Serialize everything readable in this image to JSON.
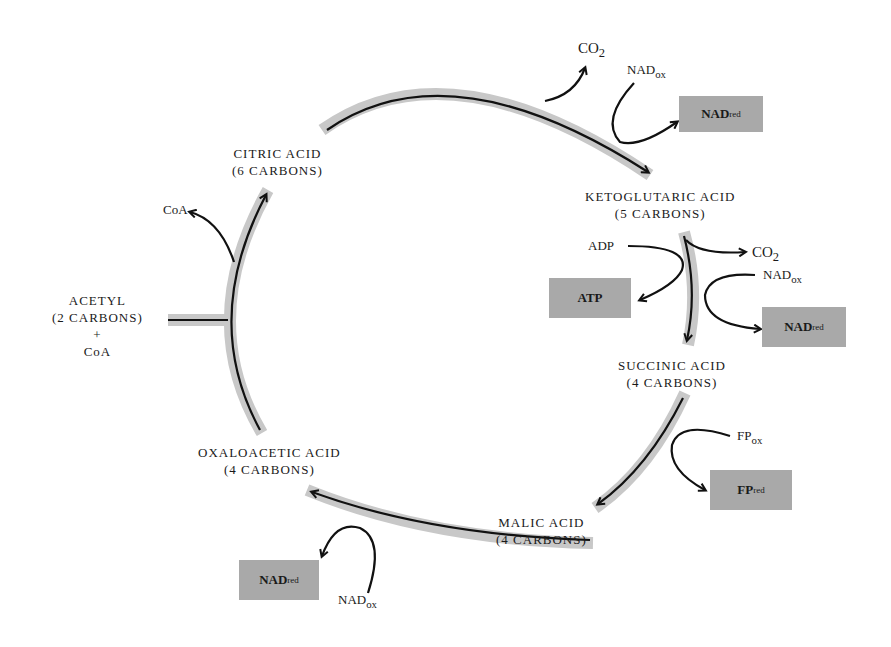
{
  "diagram": {
    "colors": {
      "band": "#c8c8c8",
      "arrow": "#111111",
      "box": "#a9a9a9"
    },
    "compounds": {
      "citric": {
        "name": "CITRIC ACID",
        "carbons": "(6 CARBONS)"
      },
      "ketoglutaric": {
        "name": "KETOGLUTARIC ACID",
        "carbons": "(5 CARBONS)"
      },
      "succinic": {
        "name": "SUCCINIC ACID",
        "carbons": "(4 CARBONS)"
      },
      "malic": {
        "name": "MALIC ACID",
        "carbons": "(4 CARBONS)"
      },
      "oxaloacetic": {
        "name": "OXALOACETIC ACID",
        "carbons": "(4 CARBONS)"
      },
      "acetyl": {
        "name": "ACETYL",
        "carbons": "(2 CARBONS)",
        "plus": "+",
        "coa": "CoA"
      }
    },
    "side": {
      "coa_out": "CoA",
      "co2_1": "CO",
      "co2_1_sub": "2",
      "nadox_1": "NAD",
      "nadox_1_sub": "ox",
      "nadred_1": "NAD",
      "nadred_1_sub": "red",
      "adp": "ADP",
      "atp": "ATP",
      "co2_2": "CO",
      "co2_2_sub": "2",
      "nadox_2": "NAD",
      "nadox_2_sub": "ox",
      "nadred_2": "NAD",
      "nadred_2_sub": "red",
      "fpox": "FP",
      "fpox_sub": "ox",
      "fpred": "FP",
      "fpred_sub": "red",
      "nadox_3": "NAD",
      "nadox_3_sub": "ox",
      "nadred_3": "NAD",
      "nadred_3_sub": "red"
    }
  }
}
